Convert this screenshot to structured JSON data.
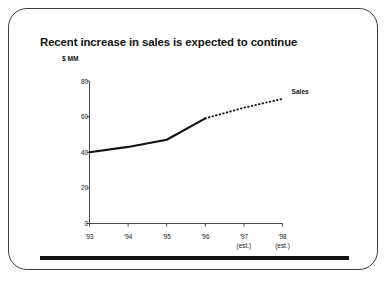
{
  "slide": {
    "title": "Recent increase in sales is expected to continue",
    "accent_color": "#111111",
    "border_color": "#3b3b3b",
    "background_color": "#ffffff"
  },
  "chart_data": {
    "type": "line",
    "title": "Recent increase in sales is expected to continue",
    "xlabel": "",
    "ylabel": "$ MM",
    "unit_label": "$ MM",
    "ylim": [
      0,
      80
    ],
    "xlim_categories": [
      "'93",
      "'94",
      "'95",
      "'96",
      "'97",
      "'98"
    ],
    "y_ticks": [
      "0",
      "20",
      "40",
      "60",
      "80"
    ],
    "y_tick_values": [
      0,
      20,
      40,
      60,
      80
    ],
    "x_tick_labels": [
      {
        "year": "'93",
        "note": ""
      },
      {
        "year": "'94",
        "note": ""
      },
      {
        "year": "'95",
        "note": ""
      },
      {
        "year": "'96",
        "note": ""
      },
      {
        "year": "'97",
        "note": "(est.)"
      },
      {
        "year": "'98",
        "note": "(est.)"
      }
    ],
    "grid": false,
    "legend_position": "end-of-line",
    "series": [
      {
        "name": "Sales",
        "categories": [
          "'93",
          "'94",
          "'95",
          "'96",
          "'97",
          "'98"
        ],
        "values": [
          40,
          43,
          47,
          59,
          65,
          70
        ],
        "actual_through": "'96",
        "actual_points": [
          {
            "x": "'93",
            "y": 40
          },
          {
            "x": "'94",
            "y": 43
          },
          {
            "x": "'95",
            "y": 47
          },
          {
            "x": "'96",
            "y": 59
          }
        ],
        "forecast_points": [
          {
            "x": "'96",
            "y": 59
          },
          {
            "x": "'97",
            "y": 65
          },
          {
            "x": "'98",
            "y": 70
          }
        ],
        "actual_style": "solid",
        "forecast_style": "dotted",
        "color": "#111111"
      }
    ],
    "annotations": [
      {
        "text": "Sales",
        "anchor": "'98"
      }
    ]
  }
}
